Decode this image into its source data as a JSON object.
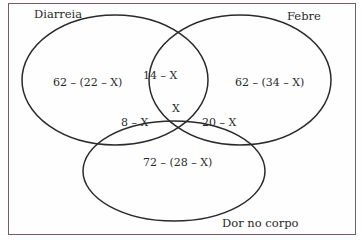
{
  "diagram": {
    "type": "venn",
    "sets": [
      {
        "id": "diarreia",
        "label": "Diarreia"
      },
      {
        "id": "febre",
        "label": "Febre"
      },
      {
        "id": "dor",
        "label": "Dor no corpo"
      }
    ],
    "regions": {
      "diarreia_only": "62 – (22 – X)",
      "febre_only": "62 – (34 – X)",
      "dor_only": "72 – (28 – X)",
      "diarreia_febre": "14 – X",
      "diarreia_dor": "8 – X",
      "febre_dor": "20 – X",
      "all_three": "X"
    },
    "colors": {
      "stroke": "#2a2a2a",
      "frame": "#7a5a62"
    }
  }
}
